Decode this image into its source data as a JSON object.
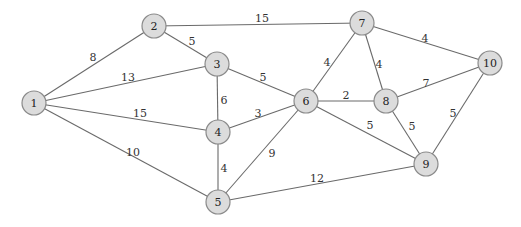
{
  "graph": {
    "title": "",
    "style": {
      "node_fill": "#dcdcdc",
      "node_stroke": "#8a8a8a",
      "edge_color": "#6a6a6a",
      "background": "#ffffff"
    },
    "nodes": [
      {
        "id": "1",
        "label": "1",
        "x": 34,
        "y": 103
      },
      {
        "id": "2",
        "label": "2",
        "x": 154,
        "y": 26
      },
      {
        "id": "3",
        "label": "3",
        "x": 217,
        "y": 64
      },
      {
        "id": "4",
        "label": "4",
        "x": 218,
        "y": 132
      },
      {
        "id": "5",
        "label": "5",
        "x": 218,
        "y": 202
      },
      {
        "id": "6",
        "label": "6",
        "x": 306,
        "y": 101
      },
      {
        "id": "7",
        "label": "7",
        "x": 362,
        "y": 23
      },
      {
        "id": "8",
        "label": "8",
        "x": 386,
        "y": 101
      },
      {
        "id": "9",
        "label": "9",
        "x": 426,
        "y": 164
      },
      {
        "id": "10",
        "label": "10",
        "x": 490,
        "y": 63
      }
    ],
    "edges": [
      {
        "from": "1",
        "to": "2",
        "weight": "8",
        "lx": 93,
        "ly": 57
      },
      {
        "from": "1",
        "to": "3",
        "weight": "13",
        "lx": 128,
        "ly": 77
      },
      {
        "from": "1",
        "to": "4",
        "weight": "15",
        "lx": 140,
        "ly": 113
      },
      {
        "from": "1",
        "to": "5",
        "weight": "10",
        "lx": 133,
        "ly": 152
      },
      {
        "from": "2",
        "to": "3",
        "weight": "5",
        "lx": 192,
        "ly": 41
      },
      {
        "from": "2",
        "to": "7",
        "weight": "15",
        "lx": 262,
        "ly": 18
      },
      {
        "from": "3",
        "to": "4",
        "weight": "6",
        "lx": 224,
        "ly": 100
      },
      {
        "from": "3",
        "to": "6",
        "weight": "5",
        "lx": 263,
        "ly": 77
      },
      {
        "from": "4",
        "to": "5",
        "weight": "4",
        "lx": 224,
        "ly": 168
      },
      {
        "from": "4",
        "to": "6",
        "weight": "3",
        "lx": 258,
        "ly": 113
      },
      {
        "from": "5",
        "to": "6",
        "weight": "9",
        "lx": 272,
        "ly": 153
      },
      {
        "from": "5",
        "to": "9",
        "weight": "12",
        "lx": 317,
        "ly": 178
      },
      {
        "from": "6",
        "to": "7",
        "weight": "4",
        "lx": 327,
        "ly": 62
      },
      {
        "from": "6",
        "to": "8",
        "weight": "2",
        "lx": 346,
        "ly": 95
      },
      {
        "from": "6",
        "to": "9",
        "weight": "5",
        "lx": 370,
        "ly": 125
      },
      {
        "from": "7",
        "to": "8",
        "weight": "4",
        "lx": 379,
        "ly": 64
      },
      {
        "from": "7",
        "to": "10",
        "weight": "4",
        "lx": 425,
        "ly": 38
      },
      {
        "from": "8",
        "to": "9",
        "weight": "5",
        "lx": 412,
        "ly": 126
      },
      {
        "from": "8",
        "to": "10",
        "weight": "7",
        "lx": 426,
        "ly": 83
      },
      {
        "from": "9",
        "to": "10",
        "weight": "5",
        "lx": 453,
        "ly": 113
      }
    ]
  }
}
